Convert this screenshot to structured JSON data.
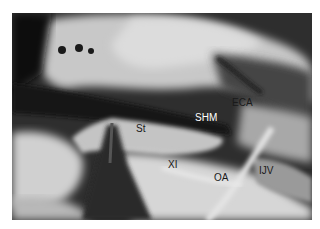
{
  "figure": {
    "kind": "grayscale intraoperative anatomical photograph",
    "labels": [
      {
        "id": "eca",
        "text": "ECA",
        "x": 232,
        "y": 98,
        "color": "#1a1a1a"
      },
      {
        "id": "shm",
        "text": "SHM",
        "x": 195,
        "y": 113,
        "color": "#ffffff"
      },
      {
        "id": "st",
        "text": "St",
        "x": 136,
        "y": 124,
        "color": "#1a1a1a"
      },
      {
        "id": "xi",
        "text": "XI",
        "x": 167,
        "y": 161,
        "color": "#1a1a1a"
      },
      {
        "id": "oa",
        "text": "OA",
        "x": 214,
        "y": 174,
        "color": "#1a1a1a"
      },
      {
        "id": "ijv",
        "text": "IJV",
        "x": 257,
        "y": 166,
        "color": "#1a1a1a"
      }
    ]
  }
}
